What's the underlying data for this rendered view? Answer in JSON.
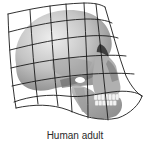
{
  "figure": {
    "caption": "Human adult",
    "overlay": "deformation-grid",
    "grid": {
      "rows": 6,
      "columns": 6,
      "line_color": "#1a1a1a"
    },
    "colors": {
      "background": "#ffffff",
      "skull_light": "#d9d9d9",
      "skull_mid": "#a8a8a8",
      "skull_dark": "#555555",
      "teeth": "#f2f2f2",
      "caption": "#2a2a2a"
    }
  }
}
